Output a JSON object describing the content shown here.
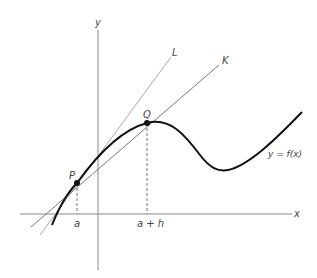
{
  "diagram": {
    "labels": {
      "y_axis": "y",
      "x_axis": "x",
      "line_L": "L",
      "line_K": "K",
      "point_P": "P",
      "point_Q": "Q",
      "tick_a": "a",
      "tick_a_plus_h": "a + h",
      "curve": "y = f(x)"
    },
    "colors": {
      "curve": "#111111",
      "axes": "#888888",
      "line_L": "#aaaaaa",
      "line_K": "#777777",
      "dashed": "#777777"
    }
  }
}
